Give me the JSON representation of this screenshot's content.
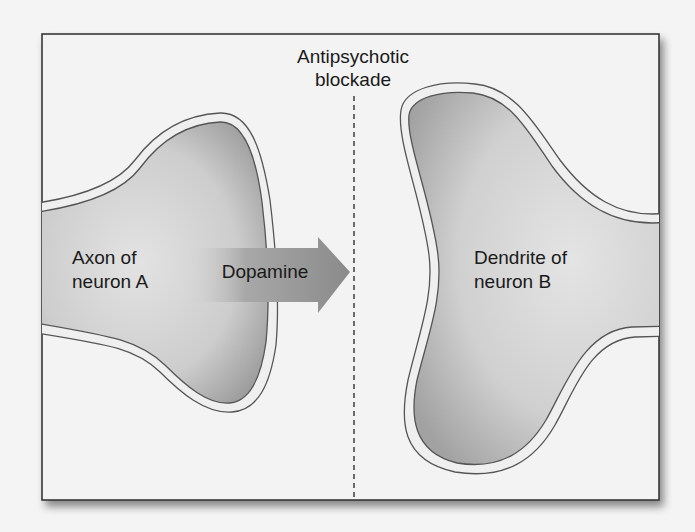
{
  "diagram": {
    "title_line1": "Antipsychotic",
    "title_line2": "blockade",
    "left_label_line1": "Axon of",
    "left_label_line2": "neuron A",
    "arrow_label": "Dopamine",
    "right_label_line1": "Dendrite of",
    "right_label_line2": "neuron B",
    "colors": {
      "background": "#f4f4f4",
      "frame": "#f3f3f3",
      "membrane_outline": "#555555",
      "membrane_fill": "#efefef",
      "cell_fill_dark": "#a9a9a9",
      "cell_fill_light": "#dcdcdc",
      "arrow_dark": "#8c8c8c",
      "blockade_line": "#222222"
    }
  }
}
